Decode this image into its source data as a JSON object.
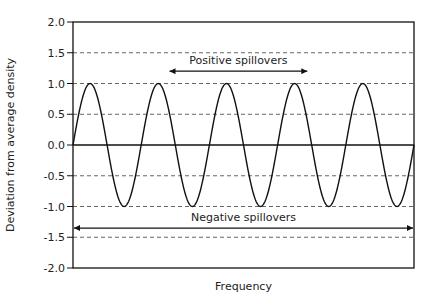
{
  "chart_data": {
    "type": "line",
    "title": "",
    "xlabel": "Frequency",
    "ylabel": "Deviation from average density",
    "ylim": [
      -2.0,
      2.0
    ],
    "yticks": [
      "2.0",
      "1.5",
      "1.0",
      "0.5",
      "0.0",
      "-0.5",
      "-1.0",
      "-1.5",
      "-2.0"
    ],
    "ytick_values": [
      2.0,
      1.5,
      1.0,
      0.5,
      0.0,
      -0.5,
      -1.0,
      -1.5,
      -2.0
    ],
    "grid": {
      "horizontal_dashed": [
        1.5,
        1.0,
        0.5,
        -0.5,
        -1.0,
        -1.5
      ],
      "zero_line_solid": true
    },
    "legend": null,
    "series": [
      {
        "name": "Density deviation",
        "function": "sine",
        "amplitude": 1.0,
        "cycles": 5,
        "description": "Sine wave oscillating between 1.0 and -1.0 over 5 full cycles, starting and ending at 0.0"
      }
    ],
    "annotations": [
      {
        "text": "Positive spillovers",
        "type": "double-arrow",
        "y": 1.2,
        "x_start_frac": 0.28,
        "x_end_frac": 0.69
      },
      {
        "text": "Negative spillovers",
        "type": "double-arrow",
        "y": -1.35,
        "x_start_frac": 0.0,
        "x_end_frac": 1.0
      }
    ]
  },
  "labels": {
    "xlabel": "Frequency",
    "ylabel": "Deviation from average density",
    "positive": "Positive spillovers",
    "negative": "Negative spillovers"
  },
  "colors": {
    "line": "#111111",
    "grid": "#555555",
    "text": "#222222"
  }
}
